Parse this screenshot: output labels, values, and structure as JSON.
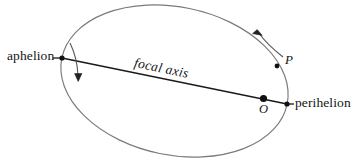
{
  "figure": {
    "kind": "orbital-ellipse-diagram",
    "width": 356,
    "height": 168,
    "background_color": "#ffffff",
    "ellipse_stroke_color": "#7a7a7a",
    "axis_stroke_color": "#1a1a1a",
    "arrow_stroke_color": "#4a4a4a",
    "dot_color": "#111111",
    "text_color": "#141414"
  },
  "labels": {
    "aphelion": "aphelion",
    "perihelion": "perihelion",
    "focal_axis": "focal axis",
    "point_p": "P",
    "point_o": "O"
  },
  "geometry": {
    "ellipse": {
      "center_x": 174.5,
      "center_y": 81,
      "semi_major": 115,
      "semi_minor": 74,
      "rotation_deg": 11.6
    },
    "focal_axis_line": {
      "x1": 62,
      "y1": 58,
      "x2": 287,
      "y2": 104
    },
    "aphelion_vertex": {
      "x": 62,
      "y": 58
    },
    "perihelion_vertex": {
      "x": 287,
      "y": 104
    },
    "focus_o": {
      "x": 263.5,
      "y": 98.5
    },
    "point_p": {
      "x": 277,
      "y": 66
    },
    "direction_arrow_upper": {
      "path": "M 282 56 C 272 48 263 39 257 31",
      "arrow_tip_x": 256,
      "arrow_tip_y": 30
    },
    "direction_arrow_lower": {
      "path": "M 70 44 C 75 56 77 68 78 77",
      "arrow_tip_x": 78,
      "arrow_tip_y": 80
    },
    "aphelion_leader_line": {
      "x1": 55,
      "y1": 58,
      "x2": 62,
      "y2": 58
    },
    "perihelion_leader_line": {
      "x1": 287,
      "y1": 104,
      "x2": 293,
      "y2": 104
    }
  }
}
